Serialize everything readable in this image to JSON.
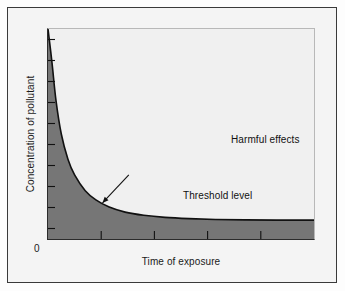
{
  "figure": {
    "background": "#fdfdfd",
    "frame_color": "#3a3a3a"
  },
  "chart_data": {
    "type": "line",
    "title": "",
    "subtitle": "",
    "xlabel": "Time of exposure",
    "ylabel": "Concentration of pollutant",
    "origin_label": "0",
    "grid": false,
    "legend_position": "none",
    "xlim": [
      0,
      10
    ],
    "ylim": [
      0,
      10
    ],
    "x_tick_labels": [],
    "y_tick_labels": [],
    "x_tick_count": 4,
    "y_tick_count": 10,
    "series": [
      {
        "name": "Threshold level",
        "type": "curve",
        "description": "Hyperbolic decay curve separating harmful from non-harmful exposure",
        "color": "#111111",
        "fill_color": "#767676",
        "fill_below": true,
        "x": [
          0.0,
          0.15,
          0.3,
          0.5,
          0.75,
          1.0,
          1.4,
          1.8,
          2.3,
          2.9,
          3.6,
          4.4,
          5.3,
          6.3,
          7.4,
          8.6,
          10.0
        ],
        "y": [
          10.0,
          8.4,
          6.6,
          5.0,
          3.8,
          3.05,
          2.3,
          1.86,
          1.52,
          1.28,
          1.13,
          1.03,
          0.97,
          0.93,
          0.91,
          0.9,
          0.9
        ]
      }
    ],
    "annotations": [
      {
        "id": "harmful",
        "text": "Harmful effects",
        "x": 5.1,
        "y": 5.7,
        "color": "#111111"
      },
      {
        "id": "no-harmful",
        "text": "No harmful effects",
        "x": 0.45,
        "y": 0.45,
        "color": "#111111"
      },
      {
        "id": "threshold",
        "text": "Threshold level",
        "x": 3.3,
        "y": 3.25,
        "color": "#111111",
        "arrow": true,
        "arrow_target_x": 2.05,
        "arrow_target_y": 1.72
      }
    ]
  },
  "labels": {
    "harmful": "Harmful effects",
    "no_harmful": "No harmful effects",
    "threshold": "Threshold level"
  },
  "colors": {
    "curve": "#111111",
    "fill": "#767676",
    "panel_background": "#f0f0f0",
    "axis": "#2b2b2b",
    "page_background": "#f4f4f4",
    "text": "#111111"
  }
}
